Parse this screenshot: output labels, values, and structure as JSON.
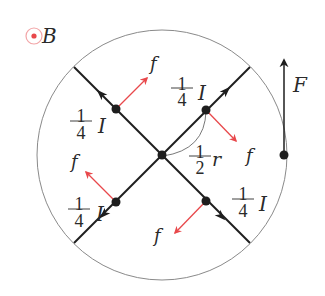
{
  "figure": {
    "width": 325,
    "height": 296,
    "colors": {
      "line": "#1e1e1e",
      "circle": "#8a8a8a",
      "force_red": "#e8484b",
      "text": "#2a2a2a",
      "b_ring": "#f2a5a7",
      "b_dot": "#e8484b"
    },
    "field_symbol": {
      "label": "B",
      "direction": "out-of-page",
      "cx": 34,
      "cy": 36,
      "r": 8,
      "label_x": 41,
      "label_y": 43
    },
    "loop": {
      "cx": 162,
      "cy": 155,
      "r": 125
    },
    "wires": [
      {
        "name": "wire-top-left",
        "x1": 162,
        "y1": 155,
        "x2": 74,
        "y2": 67
      },
      {
        "name": "wire-top-right",
        "x1": 162,
        "y1": 155,
        "x2": 250,
        "y2": 67
      },
      {
        "name": "wire-bottom-left",
        "x1": 162,
        "y1": 155,
        "x2": 74,
        "y2": 243
      },
      {
        "name": "wire-bottom-right",
        "x1": 162,
        "y1": 155,
        "x2": 250,
        "y2": 243
      }
    ],
    "center_node": {
      "cx": 162,
      "cy": 155,
      "r": 4.5
    },
    "segment_nodes": [
      {
        "name": "node-top-left",
        "cx": 116,
        "cy": 109
      },
      {
        "name": "node-top-right",
        "cx": 206,
        "cy": 110
      },
      {
        "name": "node-bottom-left",
        "cx": 116,
        "cy": 202
      },
      {
        "name": "node-bottom-right",
        "cx": 206,
        "cy": 201
      }
    ],
    "current_arrows": [
      {
        "name": "current-arrow-top-left",
        "x": 101,
        "y": 94,
        "angle": -135
      },
      {
        "name": "current-arrow-top-right",
        "x": 226,
        "y": 91,
        "angle": -45
      },
      {
        "name": "current-arrow-bottom-left",
        "x": 104,
        "y": 214,
        "angle": 135
      },
      {
        "name": "current-arrow-bottom-right",
        "x": 221,
        "y": 216,
        "angle": 45
      }
    ],
    "forces": [
      {
        "name": "force-f-top-left",
        "x1": 116,
        "y1": 109,
        "x2": 147,
        "y2": 78,
        "label": "f",
        "lx": 150,
        "ly": 70
      },
      {
        "name": "force-f-top-right",
        "x1": 206,
        "y1": 110,
        "x2": 236,
        "y2": 141,
        "label": "f",
        "lx": 246,
        "ly": 162
      },
      {
        "name": "force-f-bottom-left",
        "x1": 116,
        "y1": 202,
        "x2": 86,
        "y2": 172,
        "label": "f",
        "lx": 71,
        "ly": 168
      },
      {
        "name": "force-f-bottom-right",
        "x1": 206,
        "y1": 201,
        "x2": 175,
        "y2": 233,
        "label": "f",
        "lx": 154,
        "ly": 242
      }
    ],
    "net_force": {
      "label": "F",
      "x": 284,
      "y_base": 155,
      "y_tip": 60,
      "label_x": 293,
      "label_y": 92
    },
    "current_labels": [
      {
        "name": "label-current-top-left",
        "numerator": "1",
        "denominator": "4",
        "symbol": "I",
        "cx": 81,
        "top": 113,
        "bar": 121,
        "bottom": 139,
        "ix": 98,
        "iy": 133
      },
      {
        "name": "label-current-top-right",
        "numerator": "1",
        "denominator": "4",
        "symbol": "I",
        "cx": 182,
        "top": 81,
        "bar": 88,
        "bottom": 106,
        "ix": 198,
        "iy": 100
      },
      {
        "name": "label-current-bottom-left",
        "numerator": "1",
        "denominator": "4",
        "symbol": "I",
        "cx": 79,
        "top": 201,
        "bar": 209,
        "bottom": 227,
        "ix": 96,
        "iy": 221
      },
      {
        "name": "label-current-bottom-right",
        "numerator": "1",
        "denominator": "4",
        "symbol": "I",
        "cx": 243,
        "top": 191,
        "bar": 199,
        "bottom": 217,
        "ix": 259,
        "iy": 211
      }
    ],
    "radius_label": {
      "numerator": "1",
      "denominator": "2",
      "symbol": "r",
      "cx": 200,
      "top": 149,
      "bar": 156,
      "bottom": 174,
      "sx": 212,
      "sy": 166
    },
    "radius_arc": {
      "path": "M 163 156 Q 205 150 206 111"
    }
  }
}
